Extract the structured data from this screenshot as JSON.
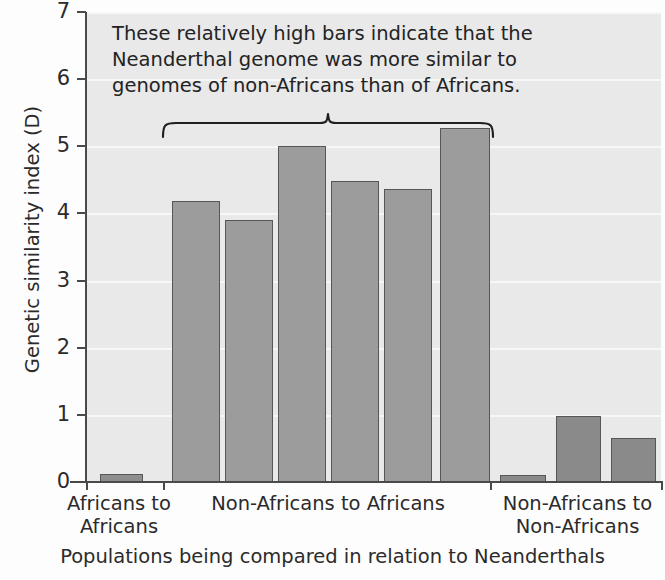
{
  "chart_data": {
    "type": "bar",
    "title": "",
    "xlabel": "Populations being compared in relation to Neanderthals",
    "ylabel": "Genetic similarity index (D)",
    "ylim": [
      0,
      7
    ],
    "yticks": [
      0,
      1,
      2,
      3,
      4,
      5,
      6,
      7
    ],
    "ytick_labels": [
      "0",
      "1",
      "2",
      "3",
      "4",
      "5",
      "6",
      "7"
    ],
    "grid": true,
    "legend": "none",
    "categories": [
      "Africans to Africans",
      "Non-Africans to Africans",
      "Non-Africans to Non-Africans"
    ],
    "bars": [
      {
        "group": "Africans to Africans",
        "value": 0.12,
        "color": "#8e8e8e"
      },
      {
        "group": "Non-Africans to Africans",
        "value": 4.19,
        "color": "#9c9c9c"
      },
      {
        "group": "Non-Africans to Africans",
        "value": 3.9,
        "color": "#9c9c9c"
      },
      {
        "group": "Non-Africans to Africans",
        "value": 5.0,
        "color": "#9c9c9c"
      },
      {
        "group": "Non-Africans to Africans",
        "value": 4.48,
        "color": "#9c9c9c"
      },
      {
        "group": "Non-Africans to Africans",
        "value": 4.37,
        "color": "#9c9c9c"
      },
      {
        "group": "Non-Africans to Africans",
        "value": 5.27,
        "color": "#9c9c9c"
      },
      {
        "group": "Non-Africans to Non-Africans",
        "value": 0.1,
        "color": "#8a8a8a"
      },
      {
        "group": "Non-Africans to Non-Africans",
        "value": 0.98,
        "color": "#8a8a8a"
      },
      {
        "group": "Non-Africans to Non-Africans",
        "value": 0.66,
        "color": "#8a8a8a"
      }
    ],
    "annotation": {
      "lines": [
        "These relatively high bars indicate that the",
        "Neanderthal genome was more similar to",
        "genomes of non-Africans than of Africans."
      ],
      "brace_spans_group": "Non-Africans to Africans"
    },
    "group_labels": [
      {
        "line1": "Africans to",
        "line2": "Africans"
      },
      {
        "line1": "Non-Africans to Africans",
        "line2": ""
      },
      {
        "line1": "Non-Africans to",
        "line2": "Non-Africans"
      }
    ],
    "colors": {
      "plot_background": "#e9e9e9",
      "gridline": "#f7f7f7",
      "axis": "#4a4a4a",
      "bar_light": "#9c9c9c",
      "bar_dark": "#8a8a8a",
      "bar_border": "#55555a",
      "text": "#2b2b2b"
    }
  }
}
